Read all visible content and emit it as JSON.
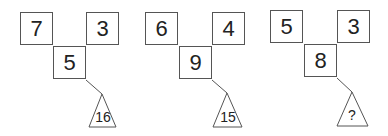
{
  "puzzle": {
    "figures": [
      {
        "left": "7",
        "right": "3",
        "middle": "5",
        "triangle": "16"
      },
      {
        "left": "6",
        "right": "4",
        "middle": "9",
        "triangle": "15"
      },
      {
        "left": "5",
        "right": "3",
        "middle": "8",
        "triangle": "?"
      }
    ]
  },
  "colors": {
    "stroke": "#555555",
    "text": "#222222",
    "background": "#ffffff"
  }
}
